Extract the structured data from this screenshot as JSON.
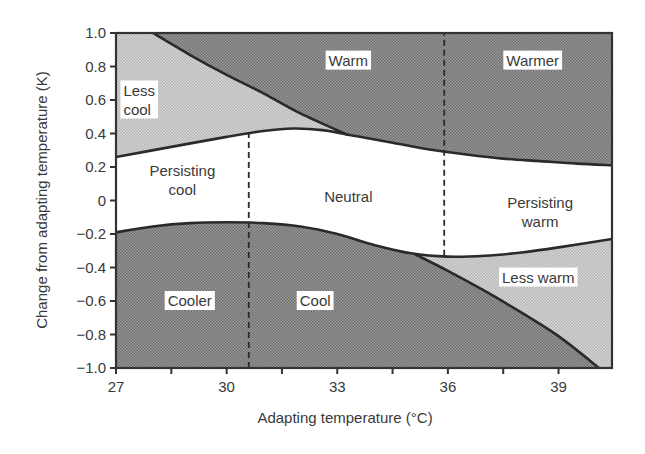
{
  "chart_data": {
    "type": "area",
    "title": "",
    "xlabel": "Adapting temperature (°C)",
    "ylabel": "Change from adapting temperature (K)",
    "xlim": [
      27,
      40.45
    ],
    "ylim": [
      -1.0,
      1.0
    ],
    "xticks": [
      27,
      30,
      33,
      36,
      39
    ],
    "xticks_minor": [
      28.5,
      31.5,
      34.5,
      37.5
    ],
    "yticks": [
      1.0,
      0.8,
      0.6,
      0.4,
      0.2,
      0,
      -0.2,
      -0.4,
      -0.6,
      -0.8,
      -1.0
    ],
    "ytick_labels": [
      "1.0",
      "0.8",
      "0.6",
      "0.4",
      "0.2",
      "0",
      "−0.2",
      "−0.4",
      "−0.6",
      "−0.8",
      "−1.0"
    ],
    "xtick_labels": [
      "27",
      "30",
      "33",
      "36",
      "39"
    ],
    "grid": false,
    "series": [
      {
        "name": "Warm threshold",
        "x": [
          27,
          28.5,
          30,
          31,
          31.8,
          32.6,
          33.5,
          34.5,
          35.5,
          36.5,
          37.5,
          38.5,
          39.5,
          40.45
        ],
        "y": [
          0.26,
          0.32,
          0.38,
          0.415,
          0.43,
          0.42,
          0.385,
          0.345,
          0.305,
          0.275,
          0.25,
          0.235,
          0.22,
          0.21
        ]
      },
      {
        "name": "Cool threshold",
        "x": [
          27,
          28,
          29,
          30,
          31,
          32,
          33,
          34,
          35,
          36,
          37,
          38,
          39,
          40.45
        ],
        "y": [
          -0.19,
          -0.155,
          -0.135,
          -0.13,
          -0.135,
          -0.155,
          -0.2,
          -0.265,
          -0.315,
          -0.335,
          -0.33,
          -0.31,
          -0.28,
          -0.23
        ]
      },
      {
        "name": "Less cool / Warm boundary",
        "x": [
          28.0,
          29.0,
          30.0,
          31.0,
          32.0,
          33.3
        ],
        "y": [
          1.0,
          0.87,
          0.75,
          0.64,
          0.52,
          0.39
        ]
      },
      {
        "name": "Cool / Less warm boundary",
        "x": [
          35.1,
          36.0,
          37.0,
          38.0,
          39.0,
          40.1
        ],
        "y": [
          -0.32,
          -0.42,
          -0.54,
          -0.67,
          -0.81,
          -1.0
        ]
      }
    ],
    "dividers": [
      {
        "name": "Lower dashed divider",
        "x": 30.6,
        "y_from": -1.0,
        "y_to": 0.43
      },
      {
        "name": "Upper dashed divider",
        "x": 35.9,
        "y_from": -0.33,
        "y_to": 1.0
      }
    ],
    "regions": [
      {
        "label": "Warm",
        "x": 33.3,
        "y": 0.835,
        "fill": "dark"
      },
      {
        "label": "Warmer",
        "x": 38.3,
        "y": 0.835,
        "fill": "dark"
      },
      {
        "label": "Less cool",
        "lines": [
          "Less",
          "cool"
        ],
        "x": 27.2,
        "y": 0.6,
        "fill": "light"
      },
      {
        "label": "Persisting cool",
        "lines": [
          "Persisting",
          "cool"
        ],
        "x": 28.8,
        "y": 0.12,
        "fill": "none"
      },
      {
        "label": "Neutral",
        "x": 33.3,
        "y": 0.02,
        "fill": "none"
      },
      {
        "label": "Persisting warm",
        "lines": [
          "Persisting",
          "warm"
        ],
        "x": 38.5,
        "y": -0.07,
        "fill": "none"
      },
      {
        "label": "Cooler",
        "x": 29.0,
        "y": -0.6,
        "fill": "dark"
      },
      {
        "label": "Cool",
        "x": 32.4,
        "y": -0.6,
        "fill": "dark"
      },
      {
        "label": "Less warm",
        "x": 38.45,
        "y": -0.46,
        "fill": "light"
      }
    ],
    "colors": {
      "dark_fill": "#8a8a8a",
      "light_fill": "#c9c9c9",
      "line": "#2a2a2a",
      "axis": "#333333"
    }
  }
}
